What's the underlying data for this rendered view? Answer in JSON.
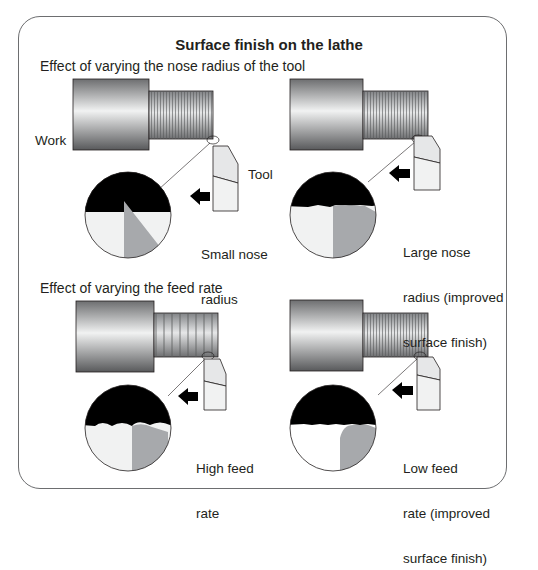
{
  "figure": {
    "title": "Surface finish on the lathe",
    "sections": [
      {
        "heading": "Effect of varying the nose radius of the tool",
        "panels": [
          {
            "id": "small-nose",
            "caption_lines": [
              "Small nose",
              "radius"
            ],
            "work_label": "Work",
            "tool_label": "Tool"
          },
          {
            "id": "large-nose",
            "caption_lines": [
              "Large nose",
              "radius (improved",
              "surface finish)"
            ]
          }
        ]
      },
      {
        "heading": "Effect of varying the feed rate",
        "panels": [
          {
            "id": "high-feed",
            "caption_lines": [
              "High feed",
              "rate"
            ]
          },
          {
            "id": "low-feed",
            "caption_lines": [
              "Low feed",
              "rate (improved",
              "surface finish)"
            ]
          }
        ]
      }
    ],
    "colors": {
      "frame": "#6d6e70",
      "chip_black": "#000000",
      "tool_gray": "#a7a9ac",
      "tool_light": "#e6e7e8",
      "work_gradient_dark": "#6d6e70",
      "work_gradient_light": "#f1f2f2"
    }
  }
}
